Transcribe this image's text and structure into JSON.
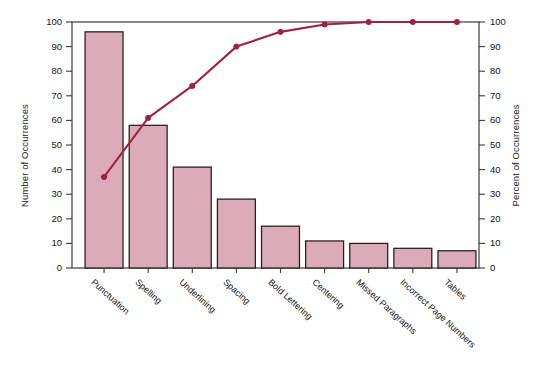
{
  "chart_data": {
    "type": "bar",
    "title": "",
    "subtitle": "",
    "xlabel": "",
    "ylabel": "Number of Occurrences",
    "y2label": "Percent of Occurrences",
    "ylim": [
      0,
      100
    ],
    "y2lim": [
      0,
      100
    ],
    "yticks": [
      0,
      10,
      20,
      30,
      40,
      50,
      60,
      70,
      80,
      90,
      100
    ],
    "y2ticks": [
      0,
      10,
      20,
      30,
      40,
      50,
      60,
      70,
      80,
      90,
      100
    ],
    "grid": false,
    "legend": "none",
    "categories": [
      "Punctuation",
      "Spelling",
      "Underlining",
      "Spacing",
      "Bold Lettering",
      "Centering",
      "Missed Paragraphs",
      "Incorrect Page Numbers",
      "Tables"
    ],
    "series": [
      {
        "name": "Number of Occurrences",
        "type": "bar",
        "axis": "left",
        "values": [
          96,
          58,
          41,
          28,
          17,
          11,
          10,
          8,
          7
        ]
      },
      {
        "name": "Percent of Occurrences",
        "type": "line",
        "axis": "right",
        "values": [
          37,
          61,
          74,
          90,
          96,
          99,
          100,
          100,
          100
        ]
      }
    ],
    "colors": {
      "bar_fill": "#dcabb9",
      "bar_border": "#2b2220",
      "line": "#9e2340",
      "marker": "#9e2340",
      "axis": "#3a3a3a",
      "text": "#141414",
      "background": "#ffffff"
    }
  },
  "axes": {
    "left_title": "Number of Occurrences",
    "right_title": "Percent of Occurrences",
    "left_ticks": [
      "0",
      "10",
      "20",
      "30",
      "40",
      "50",
      "60",
      "70",
      "80",
      "90",
      "100"
    ],
    "right_ticks": [
      "0",
      "10",
      "20",
      "30",
      "40",
      "50",
      "60",
      "70",
      "80",
      "90",
      "100"
    ]
  }
}
